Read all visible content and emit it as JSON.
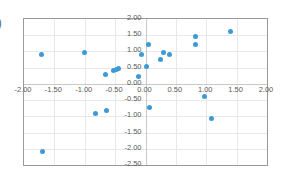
{
  "widget": {
    "name": "scatter-chart",
    "edge_glyph": ")"
  },
  "chart_data": {
    "type": "scatter",
    "title": "",
    "xlabel": "",
    "ylabel": "",
    "xlim": [
      -2.0,
      2.0
    ],
    "ylim": [
      -2.5,
      2.0
    ],
    "grid": true,
    "legend": "none",
    "x_ticks": [
      -2.0,
      -1.5,
      -1.0,
      -0.5,
      0.0,
      0.5,
      1.0,
      1.5,
      2.0
    ],
    "y_ticks": [
      -2.5,
      -2.0,
      -1.5,
      -1.0,
      -0.5,
      0.0,
      0.5,
      1.0,
      1.5,
      2.0
    ],
    "x_tick_labels": [
      "-2.00",
      "-1.50",
      "-1.00",
      "-0.50",
      "0.00",
      "0.50",
      "1.00",
      "1.50",
      "2.00"
    ],
    "y_tick_labels": [
      "-2.50",
      "-2.00",
      "-1.50",
      "-1.00",
      "-0.50",
      "0.00",
      "0.50",
      "1.00",
      "1.50",
      "2.00"
    ],
    "marker_color": "#3d9ad7",
    "series": [
      {
        "name": "Series 1",
        "points": [
          [
            -1.72,
            0.92
          ],
          [
            -1.7,
            -2.08
          ],
          [
            -1.0,
            0.98
          ],
          [
            -0.83,
            -0.9
          ],
          [
            -0.65,
            -0.82
          ],
          [
            -0.66,
            0.28
          ],
          [
            -0.52,
            0.4
          ],
          [
            -0.47,
            0.44
          ],
          [
            -0.45,
            0.46
          ],
          [
            -0.12,
            0.22
          ],
          [
            -0.07,
            0.9
          ],
          [
            0.02,
            0.55
          ],
          [
            0.05,
            1.22
          ],
          [
            0.07,
            -0.74
          ],
          [
            0.25,
            0.75
          ],
          [
            0.3,
            0.98
          ],
          [
            0.39,
            0.9
          ],
          [
            0.82,
            1.47
          ],
          [
            0.83,
            1.2
          ],
          [
            0.97,
            -0.38
          ],
          [
            1.08,
            -1.06
          ],
          [
            1.4,
            1.6
          ]
        ]
      }
    ]
  }
}
